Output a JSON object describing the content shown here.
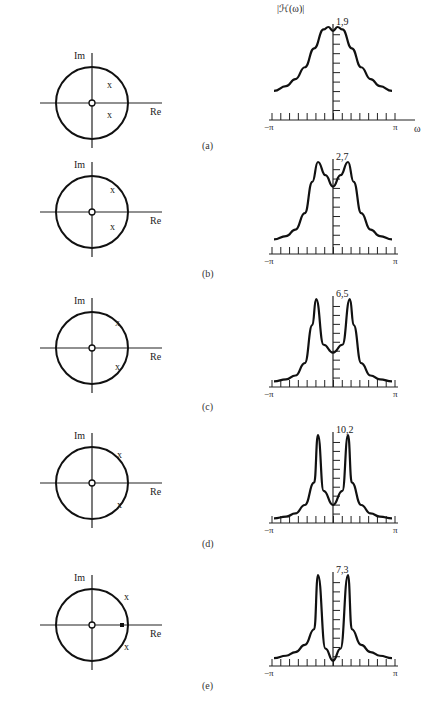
{
  "figure": {
    "panels": [
      {
        "id": "a",
        "caption": "(a)",
        "im_label": "Im",
        "re_label": "Re",
        "peak_label": "1,9",
        "y_axis_title": "|ℋ(ω)|",
        "x_min_label": "−π",
        "x_max_label": "π",
        "x_axis_title": "ω",
        "poles": [
          {
            "r": 0.45,
            "angle_deg": 45
          },
          {
            "r": 0.45,
            "angle_deg": -45
          }
        ],
        "zeros": [
          {
            "r": 0,
            "angle_deg": 0
          }
        ]
      },
      {
        "id": "b",
        "caption": "(b)",
        "im_label": "Im",
        "re_label": "Re",
        "peak_label": "2,7",
        "x_min_label": "−π",
        "x_max_label": "π",
        "poles": [
          {
            "r": 0.62,
            "angle_deg": 55
          },
          {
            "r": 0.62,
            "angle_deg": -55
          }
        ],
        "zeros": [
          {
            "r": 0,
            "angle_deg": 0
          }
        ]
      },
      {
        "id": "c",
        "caption": "(c)",
        "im_label": "Im",
        "re_label": "Re",
        "peak_label": "6,5",
        "x_min_label": "−π",
        "x_max_label": "π",
        "poles": [
          {
            "r": 0.85,
            "angle_deg": 50
          },
          {
            "r": 0.85,
            "angle_deg": -50
          }
        ],
        "zeros": [
          {
            "r": 0,
            "angle_deg": 0
          }
        ]
      },
      {
        "id": "d",
        "caption": "(d)",
        "im_label": "Im",
        "re_label": "Re",
        "peak_label": "10,2",
        "x_min_label": "−π",
        "x_max_label": "π",
        "poles": [
          {
            "r": 0.95,
            "angle_deg": 45
          },
          {
            "r": 0.95,
            "angle_deg": -45
          }
        ],
        "zeros": [
          {
            "r": 0,
            "angle_deg": 0
          }
        ]
      },
      {
        "id": "e",
        "caption": "(e)",
        "im_label": "Im",
        "re_label": "Re",
        "peak_label": "7,3",
        "x_min_label": "−π",
        "x_max_label": "π",
        "poles": [
          {
            "r": 0.95,
            "angle_deg": 45
          },
          {
            "r": 0.95,
            "angle_deg": -45
          }
        ],
        "zeros": [
          {
            "r": 0,
            "angle_deg": 0
          },
          {
            "r": 0.85,
            "angle_deg": 0
          }
        ]
      }
    ]
  },
  "chart_data": [
    {
      "type": "line",
      "title": "(a)",
      "xlabel": "ω",
      "ylabel": "|ℋ(ω)|",
      "xlim": [
        "-π",
        "π"
      ],
      "ylim": [
        0,
        1.9
      ],
      "peak": 1.9,
      "x": [
        -3.14,
        -2.5,
        -2.0,
        -1.5,
        -1.0,
        -0.5,
        -0.25,
        0,
        0.25,
        0.5,
        1.0,
        1.5,
        2.0,
        2.5,
        3.14
      ],
      "values": [
        0.55,
        0.65,
        0.8,
        1.05,
        1.45,
        1.85,
        1.9,
        1.82,
        1.9,
        1.85,
        1.45,
        1.05,
        0.8,
        0.65,
        0.55
      ]
    },
    {
      "type": "line",
      "title": "(b)",
      "xlabel": "ω",
      "ylabel": "|ℋ(ω)|",
      "xlim": [
        "-π",
        "π"
      ],
      "ylim": [
        0,
        2.7
      ],
      "peak": 2.7,
      "x": [
        -3.14,
        -2.5,
        -2.0,
        -1.5,
        -1.1,
        -0.8,
        -0.4,
        0,
        0.4,
        0.8,
        1.1,
        1.5,
        2.0,
        2.5,
        3.14
      ],
      "values": [
        0.35,
        0.45,
        0.65,
        1.15,
        2.1,
        2.7,
        2.3,
        1.95,
        2.3,
        2.7,
        2.1,
        1.15,
        0.65,
        0.45,
        0.35
      ]
    },
    {
      "type": "line",
      "title": "(c)",
      "xlabel": "ω",
      "ylabel": "|ℋ(ω)|",
      "xlim": [
        "-π",
        "π"
      ],
      "ylim": [
        0,
        6.5
      ],
      "peak": 6.5,
      "x": [
        -3.14,
        -2.5,
        -2.0,
        -1.5,
        -1.1,
        -0.9,
        -0.5,
        0,
        0.5,
        0.9,
        1.1,
        1.5,
        2.0,
        2.5,
        3.14
      ],
      "values": [
        0.2,
        0.35,
        0.65,
        1.6,
        4.5,
        6.5,
        3.0,
        2.4,
        3.0,
        6.5,
        4.5,
        1.6,
        0.65,
        0.35,
        0.2
      ]
    },
    {
      "type": "line",
      "title": "(d)",
      "xlabel": "ω",
      "ylabel": "|ℋ(ω)|",
      "xlim": [
        "-π",
        "π"
      ],
      "ylim": [
        0,
        10.2
      ],
      "peak": 10.2,
      "x": [
        -3.14,
        -2.5,
        -2.0,
        -1.5,
        -1.0,
        -0.8,
        -0.5,
        0,
        0.5,
        0.8,
        1.0,
        1.5,
        2.0,
        2.5,
        3.14
      ],
      "values": [
        0.2,
        0.4,
        0.8,
        1.8,
        4.5,
        10.2,
        3.5,
        1.8,
        3.5,
        10.2,
        4.5,
        1.8,
        0.8,
        0.4,
        0.2
      ]
    },
    {
      "type": "line",
      "title": "(e)",
      "xlabel": "ω",
      "ylabel": "|ℋ(ω)|",
      "xlim": [
        "-π",
        "π"
      ],
      "ylim": [
        0,
        7.3
      ],
      "peak": 7.3,
      "x": [
        -3.14,
        -2.5,
        -2.0,
        -1.5,
        -1.0,
        -0.8,
        -0.4,
        0,
        0.4,
        0.8,
        1.0,
        1.5,
        2.0,
        2.5,
        3.14
      ],
      "values": [
        0.4,
        0.6,
        0.9,
        1.5,
        2.8,
        7.3,
        1.2,
        0.2,
        1.2,
        7.3,
        2.8,
        1.5,
        0.9,
        0.6,
        0.4
      ]
    }
  ]
}
